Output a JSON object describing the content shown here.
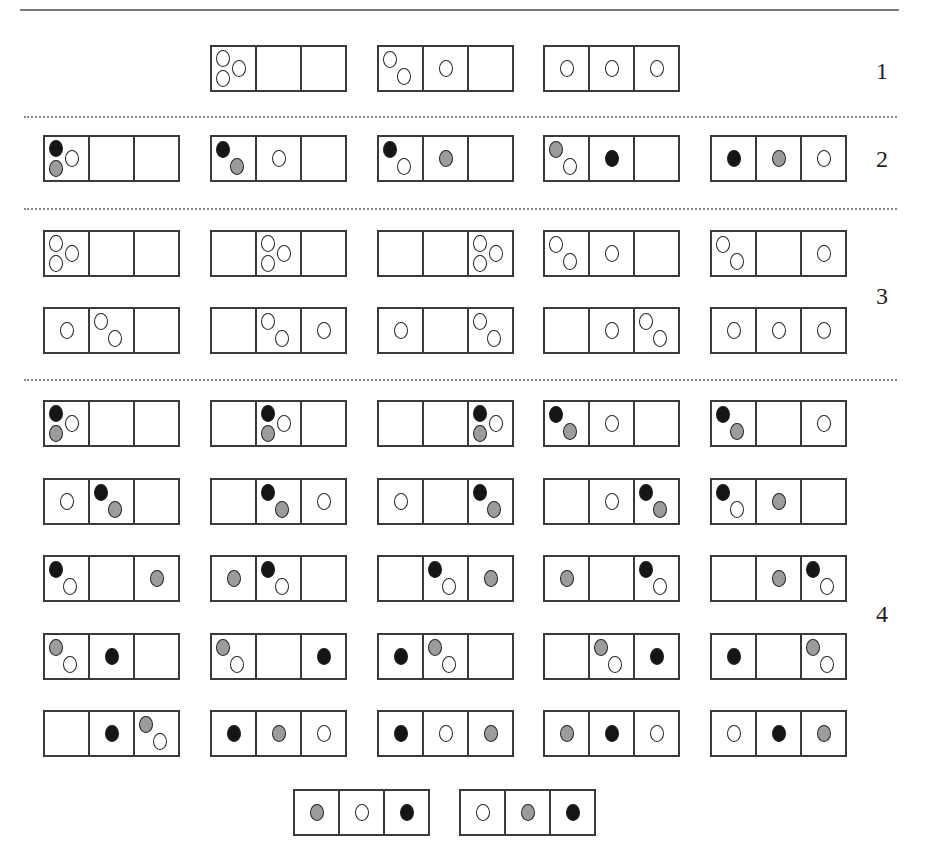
{
  "page": {
    "section_labels": [
      {
        "text": "1",
        "x": 876,
        "y": 58
      },
      {
        "text": "2",
        "x": 876,
        "y": 146
      },
      {
        "text": "3",
        "x": 876,
        "y": 283
      },
      {
        "text": "4",
        "x": 876,
        "y": 601
      }
    ],
    "separators_y": [
      116,
      208,
      379
    ],
    "colors": {
      "white": "#ffffff",
      "gray": "#9c9c9c",
      "black": "#151515",
      "line": "#3a3a3a"
    },
    "boxes": [
      {
        "section": 1,
        "x": 210,
        "y": 45,
        "cells": [
          [
            "white",
            "white",
            "white"
          ],
          [],
          []
        ]
      },
      {
        "section": 1,
        "x": 377,
        "y": 45,
        "cells": [
          [
            "white",
            "white"
          ],
          [
            "white"
          ],
          []
        ]
      },
      {
        "section": 1,
        "x": 543,
        "y": 45,
        "cells": [
          [
            "white"
          ],
          [
            "white"
          ],
          [
            "white"
          ]
        ]
      },
      {
        "section": 2,
        "x": 43,
        "y": 135,
        "cells": [
          [
            "black",
            "gray",
            "white"
          ],
          [],
          []
        ]
      },
      {
        "section": 2,
        "x": 210,
        "y": 135,
        "cells": [
          [
            "black",
            "gray"
          ],
          [
            "white"
          ],
          []
        ]
      },
      {
        "section": 2,
        "x": 377,
        "y": 135,
        "cells": [
          [
            "black",
            "white"
          ],
          [
            "gray"
          ],
          []
        ]
      },
      {
        "section": 2,
        "x": 543,
        "y": 135,
        "cells": [
          [
            "gray",
            "white"
          ],
          [
            "black"
          ],
          []
        ]
      },
      {
        "section": 2,
        "x": 710,
        "y": 135,
        "cells": [
          [
            "black"
          ],
          [
            "gray"
          ],
          [
            "white"
          ]
        ]
      },
      {
        "section": 3,
        "x": 43,
        "y": 230,
        "cells": [
          [
            "white",
            "white",
            "white"
          ],
          [],
          []
        ]
      },
      {
        "section": 3,
        "x": 210,
        "y": 230,
        "cells": [
          [],
          [
            "white",
            "white",
            "white"
          ],
          []
        ]
      },
      {
        "section": 3,
        "x": 377,
        "y": 230,
        "cells": [
          [],
          [],
          [
            "white",
            "white",
            "white"
          ]
        ]
      },
      {
        "section": 3,
        "x": 543,
        "y": 230,
        "cells": [
          [
            "white",
            "white"
          ],
          [
            "white"
          ],
          []
        ]
      },
      {
        "section": 3,
        "x": 710,
        "y": 230,
        "cells": [
          [
            "white",
            "white"
          ],
          [],
          [
            "white"
          ]
        ]
      },
      {
        "section": 3,
        "x": 43,
        "y": 307,
        "cells": [
          [
            "white"
          ],
          [
            "white",
            "white"
          ],
          []
        ]
      },
      {
        "section": 3,
        "x": 210,
        "y": 307,
        "cells": [
          [],
          [
            "white",
            "white"
          ],
          [
            "white"
          ]
        ]
      },
      {
        "section": 3,
        "x": 377,
        "y": 307,
        "cells": [
          [
            "white"
          ],
          [],
          [
            "white",
            "white"
          ]
        ]
      },
      {
        "section": 3,
        "x": 543,
        "y": 307,
        "cells": [
          [],
          [
            "white"
          ],
          [
            "white",
            "white"
          ]
        ]
      },
      {
        "section": 3,
        "x": 710,
        "y": 307,
        "cells": [
          [
            "white"
          ],
          [
            "white"
          ],
          [
            "white"
          ]
        ]
      },
      {
        "section": 4,
        "x": 43,
        "y": 400,
        "cells": [
          [
            "black",
            "gray",
            "white"
          ],
          [],
          []
        ]
      },
      {
        "section": 4,
        "x": 210,
        "y": 400,
        "cells": [
          [],
          [
            "black",
            "gray",
            "white"
          ],
          []
        ]
      },
      {
        "section": 4,
        "x": 377,
        "y": 400,
        "cells": [
          [],
          [],
          [
            "black",
            "gray",
            "white"
          ]
        ]
      },
      {
        "section": 4,
        "x": 543,
        "y": 400,
        "cells": [
          [
            "black",
            "gray"
          ],
          [
            "white"
          ],
          []
        ]
      },
      {
        "section": 4,
        "x": 710,
        "y": 400,
        "cells": [
          [
            "black",
            "gray"
          ],
          [],
          [
            "white"
          ]
        ]
      },
      {
        "section": 4,
        "x": 43,
        "y": 478,
        "cells": [
          [
            "white"
          ],
          [
            "black",
            "gray"
          ],
          []
        ]
      },
      {
        "section": 4,
        "x": 210,
        "y": 478,
        "cells": [
          [],
          [
            "black",
            "gray"
          ],
          [
            "white"
          ]
        ]
      },
      {
        "section": 4,
        "x": 377,
        "y": 478,
        "cells": [
          [
            "white"
          ],
          [],
          [
            "black",
            "gray"
          ]
        ]
      },
      {
        "section": 4,
        "x": 543,
        "y": 478,
        "cells": [
          [],
          [
            "white"
          ],
          [
            "black",
            "gray"
          ]
        ]
      },
      {
        "section": 4,
        "x": 710,
        "y": 478,
        "cells": [
          [
            "black",
            "white"
          ],
          [
            "gray"
          ],
          []
        ]
      },
      {
        "section": 4,
        "x": 43,
        "y": 555,
        "cells": [
          [
            "black",
            "white"
          ],
          [],
          [
            "gray"
          ]
        ]
      },
      {
        "section": 4,
        "x": 210,
        "y": 555,
        "cells": [
          [
            "gray"
          ],
          [
            "black",
            "white"
          ],
          []
        ]
      },
      {
        "section": 4,
        "x": 377,
        "y": 555,
        "cells": [
          [],
          [
            "black",
            "white"
          ],
          [
            "gray"
          ]
        ]
      },
      {
        "section": 4,
        "x": 543,
        "y": 555,
        "cells": [
          [
            "gray"
          ],
          [],
          [
            "black",
            "white"
          ]
        ]
      },
      {
        "section": 4,
        "x": 710,
        "y": 555,
        "cells": [
          [],
          [
            "gray"
          ],
          [
            "black",
            "white"
          ]
        ]
      },
      {
        "section": 4,
        "x": 43,
        "y": 633,
        "cells": [
          [
            "gray",
            "white"
          ],
          [
            "black"
          ],
          []
        ]
      },
      {
        "section": 4,
        "x": 210,
        "y": 633,
        "cells": [
          [
            "gray",
            "white"
          ],
          [],
          [
            "black"
          ]
        ]
      },
      {
        "section": 4,
        "x": 377,
        "y": 633,
        "cells": [
          [
            "black"
          ],
          [
            "gray",
            "white"
          ],
          []
        ]
      },
      {
        "section": 4,
        "x": 543,
        "y": 633,
        "cells": [
          [],
          [
            "gray",
            "white"
          ],
          [
            "black"
          ]
        ]
      },
      {
        "section": 4,
        "x": 710,
        "y": 633,
        "cells": [
          [
            "black"
          ],
          [],
          [
            "gray",
            "white"
          ]
        ]
      },
      {
        "section": 4,
        "x": 43,
        "y": 710,
        "cells": [
          [],
          [
            "black"
          ],
          [
            "gray",
            "white"
          ]
        ]
      },
      {
        "section": 4,
        "x": 210,
        "y": 710,
        "cells": [
          [
            "black"
          ],
          [
            "gray"
          ],
          [
            "white"
          ]
        ]
      },
      {
        "section": 4,
        "x": 377,
        "y": 710,
        "cells": [
          [
            "black"
          ],
          [
            "white"
          ],
          [
            "gray"
          ]
        ]
      },
      {
        "section": 4,
        "x": 543,
        "y": 710,
        "cells": [
          [
            "gray"
          ],
          [
            "black"
          ],
          [
            "white"
          ]
        ]
      },
      {
        "section": 4,
        "x": 710,
        "y": 710,
        "cells": [
          [
            "white"
          ],
          [
            "black"
          ],
          [
            "gray"
          ]
        ]
      },
      {
        "section": 4,
        "x": 293,
        "y": 789,
        "cells": [
          [
            "gray"
          ],
          [
            "white"
          ],
          [
            "black"
          ]
        ]
      },
      {
        "section": 4,
        "x": 459,
        "y": 789,
        "cells": [
          [
            "white"
          ],
          [
            "gray"
          ],
          [
            "black"
          ]
        ]
      }
    ]
  }
}
